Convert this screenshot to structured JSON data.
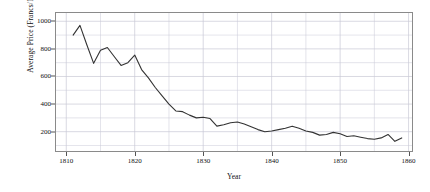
{
  "chart_data": {
    "type": "line",
    "title": "",
    "xlabel": "Year",
    "ylabel": "Average Price (Francs/100kg)",
    "xlim": [
      1808.5,
      1860.5
    ],
    "ylim": [
      60,
      1060
    ],
    "grid": true,
    "legend": "none",
    "xticks": [
      1810,
      1820,
      1830,
      1840,
      1850,
      1860
    ],
    "xtick_labels": [
      "1810",
      "1820",
      "1830",
      "1840",
      "1850",
      "1860"
    ],
    "x_minor_step": 5,
    "yticks": [
      200,
      400,
      600,
      800,
      1000
    ],
    "ytick_labels": [
      "200",
      "400",
      "600",
      "800",
      "1000"
    ],
    "y_minor_step": 100,
    "line_color": "#333333",
    "line_width": 1.1,
    "grid_color": "#c9c9d6",
    "axis_color": "#8a8a8a",
    "background": "#ffffff",
    "series": [
      {
        "name": "Average Price",
        "x": [
          1811,
          1812,
          1813,
          1814,
          1815,
          1816,
          1817,
          1818,
          1819,
          1820,
          1821,
          1822,
          1823,
          1824,
          1825,
          1826,
          1827,
          1828,
          1829,
          1830,
          1831,
          1832,
          1833,
          1834,
          1835,
          1836,
          1837,
          1838,
          1839,
          1840,
          1841,
          1842,
          1843,
          1844,
          1845,
          1846,
          1847,
          1848,
          1849,
          1850,
          1851,
          1852,
          1853,
          1854,
          1855,
          1856,
          1857,
          1858,
          1859
        ],
        "y": [
          900,
          970,
          830,
          695,
          790,
          810,
          745,
          680,
          700,
          755,
          650,
          590,
          520,
          460,
          400,
          350,
          345,
          320,
          300,
          305,
          295,
          240,
          250,
          265,
          270,
          255,
          235,
          215,
          200,
          205,
          215,
          225,
          240,
          225,
          205,
          195,
          175,
          180,
          195,
          185,
          165,
          170,
          160,
          150,
          145,
          155,
          180,
          130,
          155
        ]
      }
    ]
  }
}
